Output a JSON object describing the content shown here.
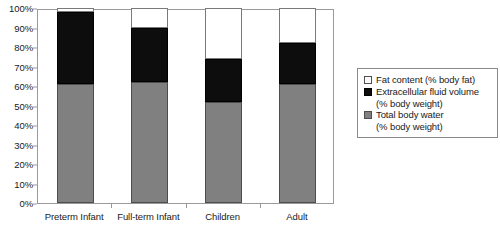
{
  "chart_data": {
    "type": "bar",
    "subtype": "stacked-100-percent-column",
    "title": "",
    "xlabel": "",
    "ylabel": "",
    "ylim": [
      0,
      100
    ],
    "ytick_labels": [
      "100%",
      "90%",
      "80%",
      "70%",
      "60%",
      "50%",
      "40%",
      "30%",
      "20%",
      "10%",
      "0%"
    ],
    "ytick_values": [
      100,
      90,
      80,
      70,
      60,
      50,
      40,
      30,
      20,
      10,
      0
    ],
    "grid": false,
    "legend_position": "right",
    "categories": [
      "Preterm Infant",
      "Full-term Infant",
      "Children",
      "Adult"
    ],
    "series": [
      {
        "name": "Total body water (% body weight)",
        "legend_label_line1": "Total body water",
        "legend_label_line2": "(% body weight)",
        "color": "#808080",
        "swatch": "gray-swatch",
        "values": [
          61,
          62,
          52,
          61
        ]
      },
      {
        "name": "Extracellular fluid volume (% body weight)",
        "legend_label_line1": "Extracellular fluid volume",
        "legend_label_line2": "(% body weight)",
        "color": "#0d0d0d",
        "swatch": "black-swatch",
        "values": [
          37,
          28,
          22,
          21
        ]
      },
      {
        "name": "Fat content (% body fat)",
        "legend_label_line1": "Fat content (% body fat)",
        "legend_label_line2": "",
        "color": "#ffffff",
        "swatch": "white-swatch",
        "values": [
          2,
          10,
          26,
          18
        ]
      }
    ],
    "cumulative_tops": {
      "water": [
        61,
        62,
        52,
        61
      ],
      "ecf": [
        98,
        90,
        74,
        82
      ],
      "fat": [
        100,
        100,
        100,
        100
      ]
    }
  },
  "colors": {
    "axis": "#9a9a9a",
    "text": "#1a1a1a",
    "plot_background": "#ffffff",
    "legend_border": "#8a8a8a"
  }
}
